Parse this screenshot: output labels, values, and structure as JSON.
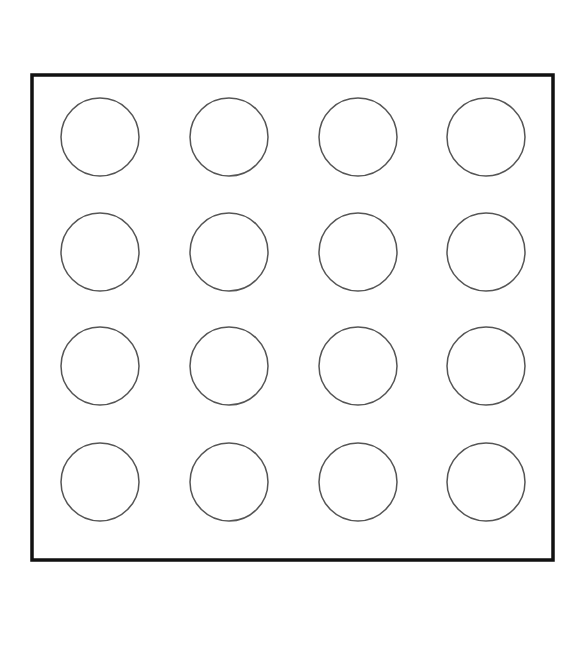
{
  "diagram": {
    "type": "grid-of-circles",
    "rows": 4,
    "columns": 4,
    "frame": {
      "x": 32,
      "y": 75,
      "width": 521,
      "height": 485,
      "stroke": "#111111",
      "stroke_width": 3.5
    },
    "circle": {
      "radius": 39,
      "stroke": "#555555",
      "stroke_width": 1.5,
      "fill": "#ffffff"
    },
    "column_centers": [
      100,
      229,
      358,
      486
    ],
    "row_centers": [
      137,
      252,
      366,
      482
    ],
    "background": "#ffffff"
  }
}
